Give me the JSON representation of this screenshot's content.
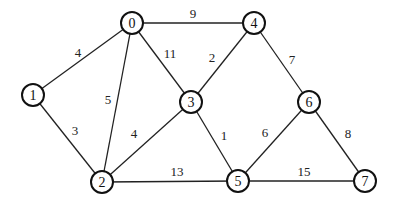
{
  "graph": {
    "type": "weighted-undirected",
    "nodes": [
      {
        "id": "0",
        "label": "0",
        "x": 132,
        "y": 23
      },
      {
        "id": "1",
        "label": "1",
        "x": 33,
        "y": 95
      },
      {
        "id": "2",
        "label": "2",
        "x": 102,
        "y": 182
      },
      {
        "id": "3",
        "label": "3",
        "x": 191,
        "y": 102
      },
      {
        "id": "4",
        "label": "4",
        "x": 254,
        "y": 23
      },
      {
        "id": "5",
        "label": "5",
        "x": 238,
        "y": 181
      },
      {
        "id": "6",
        "label": "6",
        "x": 309,
        "y": 102
      },
      {
        "id": "7",
        "label": "7",
        "x": 365,
        "y": 181
      }
    ],
    "edges": [
      {
        "from": "0",
        "to": "4",
        "weight": "9",
        "lx": 193,
        "ly": 13
      },
      {
        "from": "0",
        "to": "1",
        "weight": "4",
        "lx": 78,
        "ly": 52
      },
      {
        "from": "0",
        "to": "2",
        "weight": "5",
        "lx": 108,
        "ly": 99
      },
      {
        "from": "0",
        "to": "3",
        "weight": "11",
        "lx": 170,
        "ly": 53
      },
      {
        "from": "4",
        "to": "3",
        "weight": "2",
        "lx": 212,
        "ly": 57
      },
      {
        "from": "4",
        "to": "6",
        "weight": "7",
        "lx": 292,
        "ly": 59
      },
      {
        "from": "1",
        "to": "2",
        "weight": "3",
        "lx": 75,
        "ly": 130
      },
      {
        "from": "3",
        "to": "2",
        "weight": "4",
        "lx": 134,
        "ly": 133
      },
      {
        "from": "3",
        "to": "5",
        "weight": "1",
        "lx": 224,
        "ly": 135
      },
      {
        "from": "6",
        "to": "5",
        "weight": "6",
        "lx": 265,
        "ly": 132
      },
      {
        "from": "6",
        "to": "7",
        "weight": "8",
        "lx": 348,
        "ly": 133
      },
      {
        "from": "2",
        "to": "5",
        "weight": "13",
        "lx": 177,
        "ly": 171
      },
      {
        "from": "5",
        "to": "7",
        "weight": "15",
        "lx": 304,
        "ly": 171
      }
    ]
  }
}
